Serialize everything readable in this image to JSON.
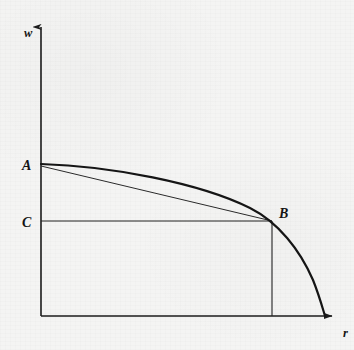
{
  "figure": {
    "title": "",
    "background_color": "#f4f4f3",
    "ink_color": "#151515"
  },
  "axes": {
    "y_axis": {
      "label": "w",
      "label_x": 24,
      "label_y": 37,
      "x": 41,
      "top": 20,
      "bottom": 316,
      "arrow": "up"
    },
    "x_axis": {
      "label": "r",
      "label_x": 343,
      "label_y": 337,
      "y": 316,
      "left": 41,
      "right": 340,
      "arrow": "right"
    }
  },
  "points": [
    {
      "name": "A",
      "label": "A",
      "x": 41,
      "y": 164,
      "label_x": 22,
      "label_y": 170,
      "description": "curve intercept on w axis"
    },
    {
      "name": "C",
      "label": "C",
      "x": 41,
      "y": 221,
      "label_x": 22,
      "label_y": 227,
      "description": "wage level on w axis"
    },
    {
      "name": "B",
      "label": "B",
      "x": 272,
      "y": 221,
      "label_x": 279,
      "label_y": 218,
      "description": "tangency point on frontier"
    }
  ],
  "chart_data": {
    "type": "line",
    "title": "",
    "xlabel": "r",
    "ylabel": "w",
    "grid": false,
    "legend": null,
    "xlim": [
      41,
      340
    ],
    "ylim": [
      316,
      20
    ],
    "series": [
      {
        "name": "wage-profit-frontier",
        "style": "curve-thick-concave",
        "path": "M 41 164 C 110 166 200 183 250 208 C 278 222 300 250 313 280 C 319 295 322 306 325 316"
      },
      {
        "name": "chord-A-to-B",
        "style": "thin-straight",
        "path": "M 41 166 L 272 221"
      },
      {
        "name": "rectangle-C-B-dropline",
        "style": "thin-straight",
        "path": "M 41 221 L 272 221 M 272 221 L 272 316"
      }
    ]
  }
}
